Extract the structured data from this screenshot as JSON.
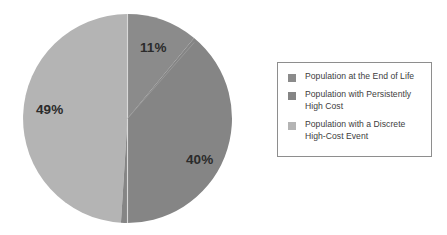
{
  "chart_data": {
    "type": "pie",
    "title": "",
    "subtitle": "",
    "categories": [
      "Population at the End of Life",
      "Population with Persistently High Cost",
      "Population with a Discrete High-Cost Event"
    ],
    "values": [
      11,
      40,
      49
    ],
    "value_labels": [
      "11%",
      "40%",
      "49%"
    ],
    "colors": [
      "#8b8b8b",
      "#858585",
      "#b4b4b4"
    ],
    "legend_position": "right",
    "grid": false,
    "start_angle_deg": 0,
    "direction": "clockwise",
    "units": "percent"
  },
  "pie": {
    "slices": [
      {
        "label": "11%",
        "value": 11,
        "color": "#8b8b8b",
        "name": "Population at the End of Life"
      },
      {
        "label": "40%",
        "value": 40,
        "color": "#858585",
        "name": "Population with Persistently High Cost"
      },
      {
        "label": "49%",
        "value": 49,
        "color": "#b4b4b4",
        "name": "Population with a Discrete High-Cost Event"
      }
    ]
  },
  "legend": {
    "items": [
      {
        "swatch_color": "#8b8b8b",
        "label": "Population at the End of Life"
      },
      {
        "swatch_color": "#858585",
        "label": "Population with Persistently High Cost"
      },
      {
        "swatch_color": "#b4b4b4",
        "label": "Population with a Discrete High-Cost Event"
      }
    ],
    "border_color": "#8e8e8e"
  }
}
